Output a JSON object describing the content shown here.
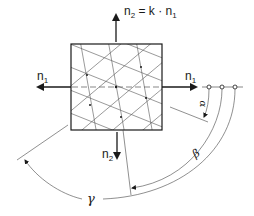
{
  "diagram": {
    "type": "plate-element-with-triangular-mesh",
    "labels": {
      "n2_top_base": "n",
      "n2_top_sub": "2",
      "n2_top_eq": " = k · n",
      "n2_top_eq_sub": "1",
      "n1_left_base": "n",
      "n1_left_sub": "1",
      "n1_right_base": "n",
      "n1_right_sub": "1",
      "n2_bottom_base": "n",
      "n2_bottom_sub": "2",
      "alpha": "α",
      "beta": "β",
      "gamma": "γ"
    },
    "colors": {
      "stroke": "#1a1a1a",
      "mesh": "#555555",
      "background": "#ffffff"
    }
  }
}
